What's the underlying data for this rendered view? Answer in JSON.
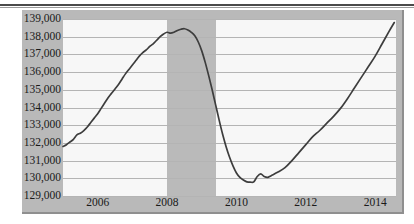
{
  "chart_data": {
    "type": "line",
    "title": "",
    "subtitle": "",
    "xlabel": "",
    "ylabel": "",
    "xlim": [
      2005.0,
      2014.6
    ],
    "ylim": [
      129000,
      139000
    ],
    "grid": true,
    "legend": "none",
    "y_tick_labels": [
      "139,000",
      "138,000",
      "137,000",
      "136,000",
      "135,000",
      "134,000",
      "133,000",
      "132,000",
      "131,000",
      "130,000",
      "129,000"
    ],
    "y_tick_values": [
      139000,
      138000,
      137000,
      136000,
      135000,
      134000,
      133000,
      132000,
      131000,
      130000,
      129000
    ],
    "x_tick_labels": [
      "2006",
      "2008",
      "2010",
      "2012",
      "2014"
    ],
    "x_tick_values": [
      2006,
      2008,
      2010,
      2012,
      2014
    ],
    "shaded_regions": [
      {
        "name": "recession",
        "x_start": 2008.0,
        "x_end": 2009.4,
        "color": "#b4b4b4"
      }
    ],
    "series": [
      {
        "name": "Total nonfarm payroll employment",
        "color": "#3d3d3d",
        "x": [
          2005.0,
          2005.1,
          2005.2,
          2005.3,
          2005.4,
          2005.5,
          2005.6,
          2005.7,
          2005.8,
          2005.9,
          2006.0,
          2006.1,
          2006.2,
          2006.3,
          2006.4,
          2006.5,
          2006.6,
          2006.7,
          2006.8,
          2006.9,
          2007.0,
          2007.1,
          2007.2,
          2007.3,
          2007.4,
          2007.5,
          2007.6,
          2007.7,
          2007.8,
          2007.9,
          2008.0,
          2008.1,
          2008.2,
          2008.3,
          2008.4,
          2008.5,
          2008.6,
          2008.7,
          2008.8,
          2008.9,
          2009.0,
          2009.1,
          2009.2,
          2009.3,
          2009.4,
          2009.5,
          2009.6,
          2009.7,
          2009.8,
          2009.9,
          2010.0,
          2010.1,
          2010.2,
          2010.3,
          2010.4,
          2010.5,
          2010.6,
          2010.7,
          2010.8,
          2010.9,
          2011.0,
          2011.2,
          2011.4,
          2011.6,
          2011.8,
          2012.0,
          2012.2,
          2012.4,
          2012.6,
          2012.8,
          2013.0,
          2013.2,
          2013.4,
          2013.6,
          2013.8,
          2014.0,
          2014.2,
          2014.4,
          2014.55
        ],
        "y": [
          131800,
          131900,
          132050,
          132200,
          132450,
          132550,
          132700,
          132900,
          133150,
          133400,
          133650,
          133950,
          134250,
          134550,
          134800,
          135050,
          135300,
          135600,
          135900,
          136150,
          136400,
          136650,
          136900,
          137100,
          137250,
          137450,
          137600,
          137800,
          138000,
          138150,
          138250,
          138200,
          138250,
          138350,
          138420,
          138450,
          138380,
          138250,
          138050,
          137700,
          137200,
          136550,
          135800,
          135000,
          134150,
          133300,
          132500,
          131800,
          131200,
          130700,
          130300,
          130050,
          129900,
          129800,
          129780,
          129800,
          130100,
          130250,
          130100,
          130050,
          130150,
          130350,
          130600,
          131000,
          131450,
          131900,
          132350,
          132700,
          133100,
          133500,
          133950,
          134500,
          135100,
          135700,
          136300,
          136900,
          137600,
          138300,
          138800
        ]
      }
    ]
  },
  "axis": {
    "y_labels": [
      "139,000",
      "138,000",
      "137,000",
      "136,000",
      "135,000",
      "134,000",
      "133,000",
      "132,000",
      "131,000",
      "130,000",
      "129,000"
    ],
    "x_labels": [
      "2006",
      "2008",
      "2010",
      "2012",
      "2014"
    ]
  }
}
